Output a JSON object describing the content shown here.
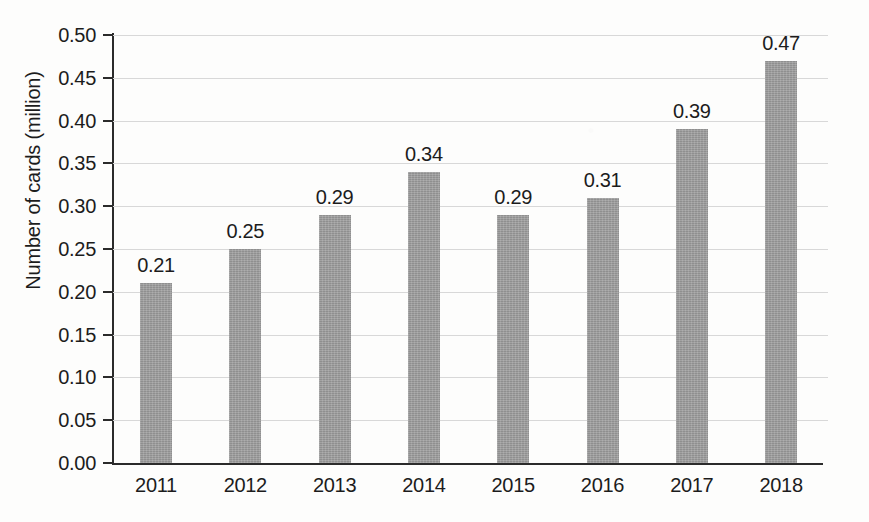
{
  "chart_data": {
    "type": "bar",
    "title": "",
    "subtitle": "",
    "xlabel": "",
    "ylabel": "Number of cards (million)",
    "categories": [
      "2011",
      "2012",
      "2013",
      "2014",
      "2015",
      "2016",
      "2017",
      "2018"
    ],
    "values": [
      0.21,
      0.25,
      0.29,
      0.34,
      0.29,
      0.31,
      0.39,
      0.47
    ],
    "value_labels": [
      "0.21",
      "0.25",
      "0.29",
      "0.34",
      "0.29",
      "0.31",
      "0.39",
      "0.47"
    ],
    "ylim": [
      0.0,
      0.5
    ],
    "ytick_values": [
      0.5,
      0.45,
      0.4,
      0.35,
      0.3,
      0.25,
      0.2,
      0.15,
      0.1,
      0.05,
      0.0
    ],
    "ytick_labels": [
      "0.50",
      "0.45",
      "0.40",
      "0.35",
      "0.30",
      "0.25",
      "0.20",
      "0.15",
      "0.10",
      "0.05",
      "0.00"
    ],
    "ytick_step": 0.05,
    "grid": true,
    "grid_axis": "y",
    "legend": false,
    "legend_position": "none",
    "bar_color": "#9d9d9d",
    "axis_color": "#2b2b2b",
    "gridline_color": "#d8d8d8",
    "text_color": "#1c1c1c",
    "background_color": "#fdfdfc",
    "data_labels_position": "above-bar"
  }
}
